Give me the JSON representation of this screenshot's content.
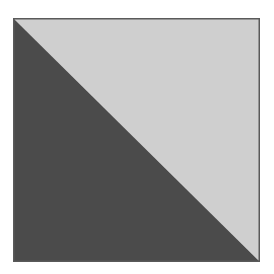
{
  "figure": {
    "upper_right_triangle_color": "#cfcfcf",
    "lower_left_triangle_color": "#4b4b4b",
    "border_color": "#5a5a5a"
  }
}
